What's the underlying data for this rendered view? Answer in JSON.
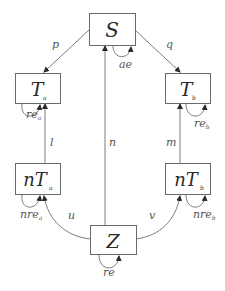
{
  "nodes": {
    "S": {
      "label": "S",
      "sub": ""
    },
    "Ta": {
      "label": "T",
      "sub": "a"
    },
    "Tb": {
      "label": "T",
      "sub": "b"
    },
    "nTa": {
      "label": "nT",
      "sub": "a"
    },
    "nTb": {
      "label": "nT",
      "sub": "b"
    },
    "Z": {
      "label": "Z",
      "sub": ""
    }
  },
  "edges": {
    "p": {
      "label": "p",
      "from": "S",
      "to": "Ta"
    },
    "q": {
      "label": "q",
      "from": "S",
      "to": "Tb"
    },
    "n": {
      "label": "n",
      "from": "Z",
      "to": "S"
    },
    "l": {
      "label": "l",
      "from": "nTa",
      "to": "Ta"
    },
    "m": {
      "label": "m",
      "from": "nTb",
      "to": "Tb"
    },
    "u": {
      "label": "u",
      "from": "Z",
      "to": "nTa"
    },
    "v": {
      "label": "v",
      "from": "Z",
      "to": "nTb"
    }
  },
  "self_loops": {
    "ae": {
      "label": "ae",
      "sub": "",
      "node": "S"
    },
    "re_a": {
      "label": "re",
      "sub": "a",
      "node": "Ta"
    },
    "re_b": {
      "label": "re",
      "sub": "b",
      "node": "Tb"
    },
    "nre_a": {
      "label": "nre",
      "sub": "a",
      "node": "nTa"
    },
    "nre_b": {
      "label": "nre",
      "sub": "b",
      "node": "nTb"
    },
    "re": {
      "label": "re",
      "sub": "",
      "node": "Z"
    }
  },
  "colors": {
    "stroke": "#6a6a6a",
    "text": "#2a2a2a",
    "edge_text": "#555555"
  }
}
